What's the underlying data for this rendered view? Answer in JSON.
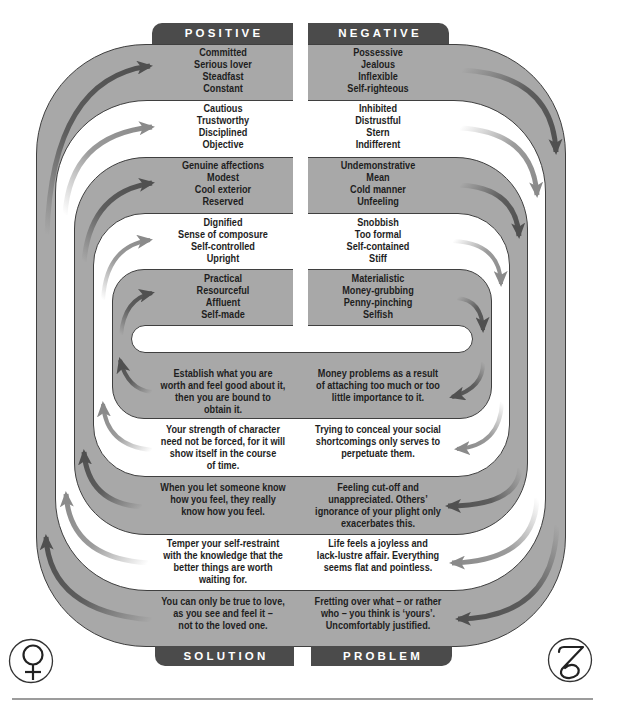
{
  "headers": {
    "positive": "POSITIVE",
    "negative": "NEGATIVE",
    "solution": "SOLUTION",
    "problem": "PROBLEM"
  },
  "positive": [
    [
      "Committed",
      "Serious lover",
      "Steadfast",
      "Constant"
    ],
    [
      "Cautious",
      "Trustworthy",
      "Disciplined",
      "Objective"
    ],
    [
      "Genuine affections",
      "Modest",
      "Cool exterior",
      "Reserved"
    ],
    [
      "Dignified",
      "Sense of composure",
      "Self-controlled",
      "Upright"
    ],
    [
      "Practical",
      "Resourceful",
      "Affluent",
      "Self-made"
    ]
  ],
  "negative": [
    [
      "Possessive",
      "Jealous",
      "Inflexible",
      "Self-righteous"
    ],
    [
      "Inhibited",
      "Distrustful",
      "Stern",
      "Indifferent"
    ],
    [
      "Undemonstrative",
      "Mean",
      "Cold manner",
      "Unfeeling"
    ],
    [
      "Snobbish",
      "Too formal",
      "Self-contained",
      "Stiff"
    ],
    [
      "Materialistic",
      "Money-grubbing",
      "Penny-pinching",
      "Selfish"
    ]
  ],
  "solution": [
    [
      "You can only be true to love,",
      "as you see and feel it –",
      "not to the loved one."
    ],
    [
      "Temper your self-restraint",
      "with the knowledge that the",
      "better things are worth",
      "waiting for."
    ],
    [
      "When you let someone know",
      "how you feel, they really",
      "know how you feel."
    ],
    [
      "Your strength of character",
      "need not be forced, for it will",
      "show itself in the course",
      "of time."
    ],
    [
      "Establish what you are",
      "worth and feel good about it,",
      "then you are bound to",
      "obtain it."
    ]
  ],
  "problem": [
    [
      "Fretting over what – or rather",
      "who – you think is ‘yours’.",
      "Uncomfortably justified."
    ],
    [
      "Life feels a joyless and",
      "lack-lustre affair. Everything",
      "seems flat and pointless."
    ],
    [
      "Feeling cut-off and",
      "unappreciated. Others’",
      "ignorance of your plight only",
      "exacerbates this."
    ],
    [
      "Trying to conceal your social",
      "shortcomings only serves to",
      "perpetuate them."
    ],
    [
      "Money problems as a result",
      "of attaching too much or too",
      "little importance to it."
    ]
  ],
  "symbols": {
    "left": "venus-symbol",
    "right": "capricorn-symbol"
  },
  "flow_direction": "clockwise",
  "colors": {
    "band_gray": "#a8a8a8",
    "band_white": "#ffffff",
    "band_outline": "#3f3f3f",
    "tab_dark": "#4b4b4b",
    "tab_text": "#ffffff",
    "arrow_dark": "#505050",
    "arrow_light": "#8a8a8a",
    "text": "#1e1e1e"
  }
}
